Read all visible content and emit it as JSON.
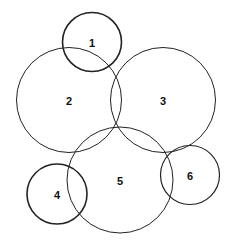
{
  "diagram": {
    "type": "overlapping-circles",
    "background": "#ffffff",
    "stroke_color": "#222222",
    "circles": [
      {
        "id": "1",
        "label": "1",
        "cx": 92,
        "cy": 42,
        "r": 29.5,
        "stroke_width": 1.6
      },
      {
        "id": "2",
        "label": "2",
        "cx": 69,
        "cy": 100,
        "r": 52.5,
        "stroke_width": 1.0
      },
      {
        "id": "3",
        "label": "3",
        "cx": 163,
        "cy": 100,
        "r": 52.5,
        "stroke_width": 1.0
      },
      {
        "id": "4",
        "label": "4",
        "cx": 57,
        "cy": 194,
        "r": 30,
        "stroke_width": 1.6
      },
      {
        "id": "5",
        "label": "5",
        "cx": 120,
        "cy": 180,
        "r": 53,
        "stroke_width": 1.0
      },
      {
        "id": "6",
        "label": "6",
        "cx": 190,
        "cy": 175,
        "r": 29.5,
        "stroke_width": 1.2
      }
    ]
  }
}
